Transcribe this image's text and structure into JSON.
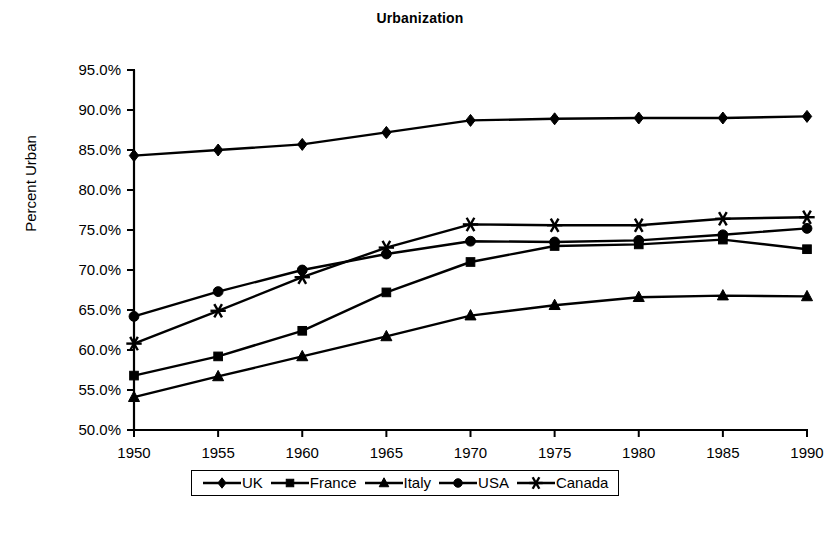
{
  "chart_data": {
    "type": "line",
    "title": "Urbanization",
    "xlabel": "",
    "ylabel": "Percent Urban",
    "x": [
      1950,
      1955,
      1960,
      1965,
      1970,
      1975,
      1980,
      1985,
      1990
    ],
    "xtick_labels": [
      "1950",
      "1955",
      "1960",
      "1965",
      "1970",
      "1975",
      "1980",
      "1985",
      "1990"
    ],
    "ytick_labels": [
      "50.0%",
      "55.0%",
      "60.0%",
      "65.0%",
      "70.0%",
      "75.0%",
      "80.0%",
      "85.0%",
      "90.0%",
      "95.0%"
    ],
    "ytick_values": [
      50.0,
      55.0,
      60.0,
      65.0,
      70.0,
      75.0,
      80.0,
      85.0,
      90.0,
      95.0
    ],
    "ylim": [
      50.0,
      95.0
    ],
    "xlim": [
      1950,
      1990
    ],
    "grid": false,
    "legend_position": "bottom",
    "value_unit": "percent",
    "series": [
      {
        "name": "UK",
        "marker": "diamond",
        "color": "#000000",
        "values": [
          84.3,
          85.0,
          85.7,
          87.2,
          88.7,
          88.9,
          89.0,
          89.0,
          89.2
        ]
      },
      {
        "name": "France",
        "marker": "square",
        "color": "#000000",
        "values": [
          56.8,
          59.2,
          62.4,
          67.2,
          71.0,
          73.0,
          73.2,
          73.8,
          72.6
        ]
      },
      {
        "name": "Italy",
        "marker": "triangle",
        "color": "#000000",
        "values": [
          54.1,
          56.7,
          59.2,
          61.7,
          64.3,
          65.6,
          66.6,
          66.8,
          66.7
        ]
      },
      {
        "name": "USA",
        "marker": "circle",
        "color": "#000000",
        "values": [
          64.2,
          67.3,
          70.0,
          72.0,
          73.6,
          73.5,
          73.7,
          74.4,
          75.2
        ]
      },
      {
        "name": "Canada",
        "marker": "star",
        "color": "#000000",
        "values": [
          60.8,
          64.9,
          69.1,
          72.8,
          75.7,
          75.6,
          75.6,
          76.4,
          76.6
        ]
      }
    ]
  }
}
